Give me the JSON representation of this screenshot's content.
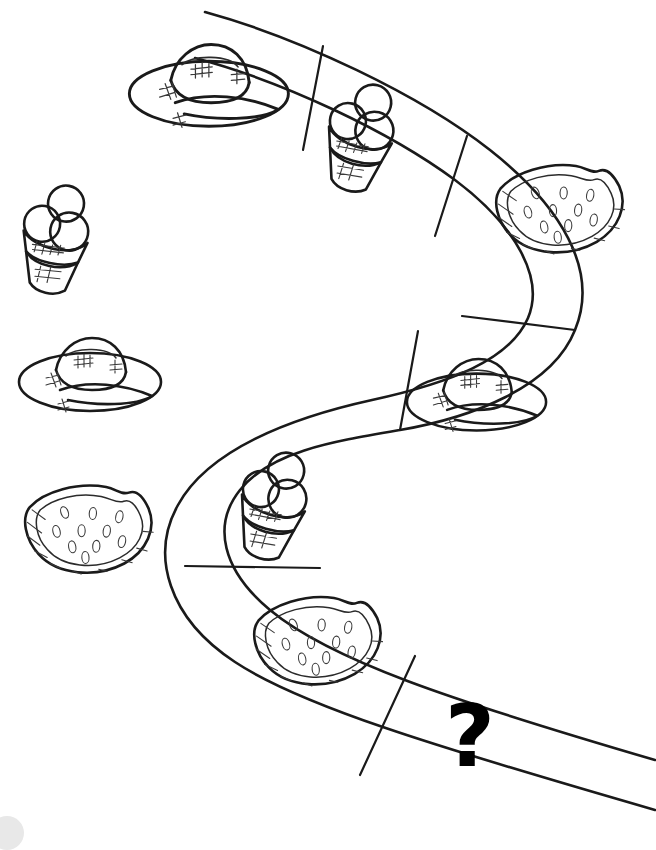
{
  "worksheet": {
    "title": "Summer Pattern Path Worksheet",
    "instruction_text": "",
    "question_mark": "?",
    "ink_color": "#1a1a1a",
    "background_color": "#ffffff",
    "page_width": 656,
    "page_height": 844
  },
  "path": {
    "name": "winding-pattern-path",
    "shape": "s-curve",
    "segment_count": 7,
    "divider_count": 6
  },
  "path_segments": [
    {
      "index": 1,
      "item": "sun-hat",
      "item_label": "Sun hat",
      "position": "top-left"
    },
    {
      "index": 2,
      "item": "ice-cream-cone",
      "item_label": "Ice cream cone",
      "position": "top-center"
    },
    {
      "index": 3,
      "item": "watermelon-slice",
      "item_label": "Watermelon slice",
      "position": "top-right"
    },
    {
      "index": 4,
      "item": "sun-hat",
      "item_label": "Sun hat",
      "position": "middle-right"
    },
    {
      "index": 5,
      "item": "ice-cream-cone",
      "item_label": "Ice cream cone",
      "position": "middle-left"
    },
    {
      "index": 6,
      "item": "watermelon-slice",
      "item_label": "Watermelon slice",
      "position": "bottom-left"
    },
    {
      "index": 7,
      "item": "question-mark",
      "item_label": "?",
      "position": "bottom-right"
    }
  ],
  "loose_items": [
    {
      "index": 1,
      "item": "ice-cream-cone",
      "item_label": "Ice cream cone",
      "position": "left-upper"
    },
    {
      "index": 2,
      "item": "sun-hat",
      "item_label": "Sun hat",
      "position": "left-middle"
    },
    {
      "index": 3,
      "item": "watermelon-slice",
      "item_label": "Watermelon slice",
      "position": "left-lower"
    }
  ],
  "decor": {
    "corner_mark": ""
  }
}
